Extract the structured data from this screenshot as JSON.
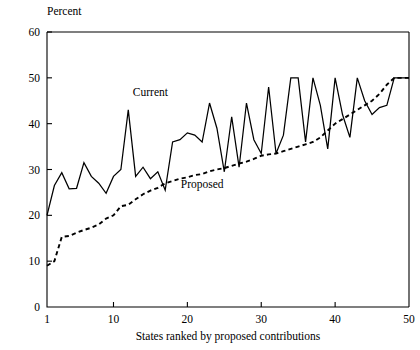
{
  "chart_data": {
    "type": "line",
    "title": "",
    "xlabel": "States ranked by proposed contributions",
    "ylabel": "Percent",
    "xlim": [
      1,
      50
    ],
    "ylim": [
      0,
      60
    ],
    "xticks": [
      1,
      10,
      20,
      30,
      40,
      50
    ],
    "xticklabels": [
      "1",
      "10",
      "20",
      "30",
      "40",
      "50"
    ],
    "yticks": [
      0,
      10,
      20,
      30,
      40,
      50,
      60
    ],
    "yticklabels": [
      "0",
      "10",
      "20",
      "30",
      "40",
      "50",
      "60"
    ],
    "grid": false,
    "legend_position": "inline-annotations",
    "annotations": [
      {
        "text": "Current",
        "x": 15,
        "y": 46
      },
      {
        "text": "Proposed",
        "x": 22,
        "y": 26
      }
    ],
    "x": [
      1,
      2,
      3,
      4,
      5,
      6,
      7,
      8,
      9,
      10,
      11,
      12,
      13,
      14,
      15,
      16,
      17,
      18,
      19,
      20,
      21,
      22,
      23,
      24,
      25,
      26,
      27,
      28,
      29,
      30,
      31,
      32,
      33,
      34,
      35,
      36,
      37,
      38,
      39,
      40,
      41,
      42,
      43,
      44,
      45,
      46,
      47,
      48,
      49,
      50
    ],
    "series": [
      {
        "name": "Current",
        "style": "solid",
        "values": [
          20.0,
          26.5,
          29.3,
          25.8,
          25.9,
          31.5,
          28.5,
          27.0,
          24.8,
          28.5,
          30.0,
          43.0,
          28.5,
          30.5,
          28.0,
          29.5,
          25.5,
          36.0,
          36.5,
          38.0,
          37.5,
          36.0,
          44.5,
          39.0,
          29.5,
          41.5,
          30.5,
          44.5,
          36.5,
          33.5,
          48.0,
          33.5,
          37.5,
          50.0,
          50.0,
          36.0,
          50.0,
          44.0,
          34.5,
          50.0,
          42.0,
          37.0,
          50.0,
          45.0,
          42.0,
          43.5,
          44.0,
          50.0,
          50.0,
          50.0
        ]
      },
      {
        "name": "Proposed",
        "style": "dashed",
        "values": [
          9.0,
          10.0,
          15.3,
          15.5,
          16.2,
          16.8,
          17.3,
          18.0,
          19.3,
          20.0,
          22.0,
          22.3,
          23.5,
          24.6,
          25.4,
          26.0,
          27.0,
          27.5,
          28.0,
          28.3,
          28.8,
          29.0,
          29.6,
          30.0,
          30.3,
          30.8,
          31.3,
          31.7,
          32.3,
          33.0,
          33.3,
          33.5,
          34.0,
          34.5,
          35.0,
          35.5,
          36.0,
          37.0,
          38.5,
          40.0,
          41.0,
          42.0,
          43.0,
          44.0,
          45.0,
          46.5,
          48.5,
          50.0,
          50.0,
          50.0
        ]
      }
    ]
  },
  "geometry": {
    "plot_left": 47,
    "plot_right": 409,
    "plot_top": 32,
    "plot_bottom": 307
  }
}
